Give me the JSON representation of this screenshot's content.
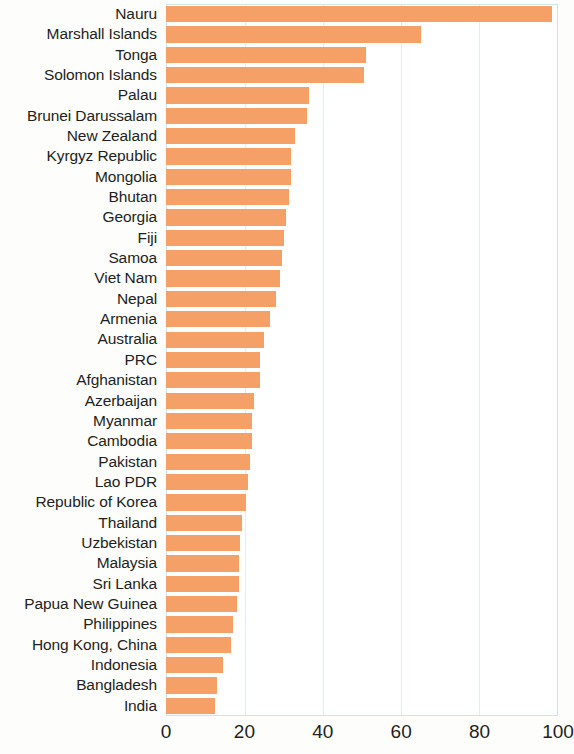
{
  "chart_data": {
    "type": "bar",
    "orientation": "horizontal",
    "title": "",
    "subtitle": "",
    "xlabel": "",
    "ylabel": "",
    "xlim": [
      0,
      100
    ],
    "xticks": [
      0,
      20,
      40,
      60,
      80,
      100
    ],
    "xtick_labels": [
      "0",
      "20",
      "40",
      "60",
      "80",
      "100"
    ],
    "grid": true,
    "grid_axis": "x",
    "legend": false,
    "bar_color": "#f5a066",
    "categories": [
      "Nauru",
      "Marshall Islands",
      "Tonga",
      "Solomon Islands",
      "Palau",
      "Brunei Darussalam",
      "New Zealand",
      "Kyrgyz Republic",
      "Mongolia",
      "Bhutan",
      "Georgia",
      "Fiji",
      "Samoa",
      "Viet Nam",
      "Nepal",
      "Armenia",
      "Australia",
      "PRC",
      "Afghanistan",
      "Azerbaijan",
      "Myanmar",
      "Cambodia",
      "Pakistan",
      "Lao PDR",
      "Republic of Korea",
      "Thailand",
      "Uzbekistan",
      "Malaysia",
      "Sri Lanka",
      "Papua New Guinea",
      "Philippines",
      "Hong Kong, China",
      "Indonesia",
      "Bangladesh",
      "India"
    ],
    "values": [
      98.5,
      65.0,
      51.0,
      50.5,
      36.5,
      36.0,
      33.0,
      32.0,
      32.0,
      31.5,
      30.5,
      30.0,
      29.5,
      29.0,
      28.0,
      26.5,
      25.0,
      24.0,
      24.0,
      22.5,
      22.0,
      22.0,
      21.5,
      21.0,
      20.5,
      19.5,
      19.0,
      18.5,
      18.5,
      18.0,
      17.0,
      16.5,
      14.5,
      13.0,
      12.5
    ]
  }
}
